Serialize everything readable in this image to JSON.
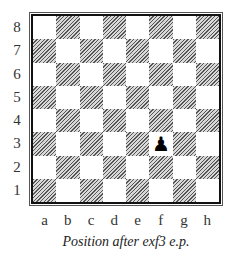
{
  "diagram": {
    "ranks": [
      "8",
      "7",
      "6",
      "5",
      "4",
      "3",
      "2",
      "1"
    ],
    "files": [
      "a",
      "b",
      "c",
      "d",
      "e",
      "f",
      "g",
      "h"
    ],
    "pieces": [
      {
        "square": "f3",
        "piece": "black-pawn",
        "glyph": "♟"
      }
    ],
    "caption": "Position after exf3 e.p."
  }
}
